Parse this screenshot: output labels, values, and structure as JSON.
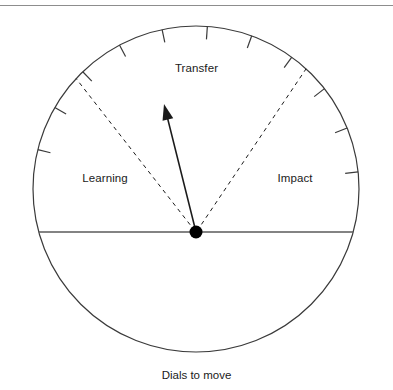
{
  "figure": {
    "caption": "Dials to move",
    "top_rule_color": "#8d8d8d"
  },
  "dial": {
    "center": {
      "x": 196,
      "y": 232
    },
    "circle_center": {
      "x": 196,
      "y": 189
    },
    "radius": 163,
    "stroke_color": "#3a3a3a",
    "baseline_color": "#5a5a5a",
    "needle_color": "#1a1a1a",
    "hub_color": "#000000",
    "sectors": [
      {
        "name": "learning",
        "label": "Learning"
      },
      {
        "name": "transfer",
        "label": "Transfer"
      },
      {
        "name": "impact",
        "label": "Impact"
      }
    ],
    "needle": {
      "label": "needle",
      "tip": {
        "x": 164,
        "y": 104
      },
      "angle_degrees": 104
    },
    "divider_left": {
      "angle_degrees": 128
    },
    "divider_right": {
      "angle_degrees": 56
    },
    "tick_angles_degrees": [
      6,
      22,
      38,
      54,
      70,
      86,
      102,
      118,
      134,
      150,
      166
    ],
    "tick_length": 13
  }
}
